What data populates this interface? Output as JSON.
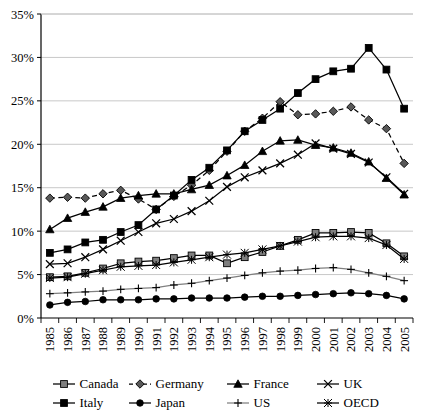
{
  "chart_data": {
    "type": "line",
    "title": "",
    "subtitle": "",
    "xlabel": "",
    "ylabel": "",
    "grid": true,
    "legend_position": "bottom",
    "x": [
      1985,
      1986,
      1987,
      1988,
      1989,
      1990,
      1991,
      1992,
      1993,
      1994,
      1995,
      1996,
      1997,
      1998,
      1999,
      2000,
      2001,
      2002,
      2003,
      2004,
      2005
    ],
    "categories": [
      "1985",
      "1986",
      "1987",
      "1988",
      "1989",
      "1990",
      "1991",
      "1992",
      "1993",
      "1994",
      "1995",
      "1996",
      "1997",
      "1998",
      "1999",
      "2000",
      "2001",
      "2002",
      "2003",
      "2004",
      "2005"
    ],
    "ylim": [
      0,
      35
    ],
    "ytick_values": [
      0,
      5,
      10,
      15,
      20,
      25,
      30,
      35
    ],
    "ytick_labels": [
      "0%",
      "5%",
      "10%",
      "15%",
      "20%",
      "25%",
      "30%",
      "35%"
    ],
    "series": [
      {
        "name": "Canada",
        "marker": "square",
        "marker_fill": "#7f7f7f",
        "line_style": "solid",
        "color": "#000000",
        "values": [
          4.7,
          4.8,
          5.2,
          5.7,
          6.3,
          6.5,
          6.6,
          6.9,
          7.2,
          7.2,
          6.3,
          7.0,
          7.6,
          8.3,
          9.0,
          9.8,
          9.8,
          9.9,
          9.8,
          8.6,
          7.1
        ]
      },
      {
        "name": "Germany",
        "marker": "diamond",
        "marker_fill": "#595959",
        "line_style": "dashed",
        "color": "#000000",
        "values": [
          13.8,
          13.9,
          13.8,
          14.3,
          14.7,
          13.7,
          12.5,
          14.0,
          15.3,
          17.0,
          19.2,
          21.5,
          23.0,
          24.9,
          23.4,
          23.5,
          23.8,
          24.3,
          22.8,
          21.8,
          17.8
        ]
      },
      {
        "name": "France",
        "marker": "triangle",
        "marker_fill": "#000000",
        "line_style": "solid",
        "color": "#000000",
        "values": [
          10.2,
          11.5,
          12.2,
          12.8,
          13.8,
          14.1,
          14.3,
          14.3,
          14.8,
          15.3,
          16.4,
          17.6,
          19.2,
          20.4,
          20.5,
          19.9,
          19.6,
          19.0,
          18.0,
          16.1,
          14.2
        ]
      },
      {
        "name": "UK",
        "marker": "cross-x",
        "marker_fill": "#000000",
        "line_style": "solid",
        "color": "#000000",
        "values": [
          6.2,
          6.3,
          7.0,
          7.9,
          8.9,
          9.9,
          10.9,
          11.4,
          12.3,
          13.5,
          15.1,
          16.2,
          17.0,
          17.8,
          18.8,
          20.1,
          19.5,
          18.9,
          17.9,
          16.2,
          14.3
        ]
      },
      {
        "name": "Italy",
        "marker": "square",
        "marker_fill": "#000000",
        "line_style": "solid",
        "color": "#000000",
        "values": [
          7.5,
          7.9,
          8.7,
          9.0,
          9.9,
          10.7,
          12.5,
          14.1,
          15.9,
          17.3,
          19.3,
          21.5,
          22.8,
          24.1,
          25.9,
          27.5,
          28.4,
          28.7,
          31.1,
          28.6,
          24.1
        ]
      },
      {
        "name": "Japan",
        "marker": "circle",
        "marker_fill": "#000000",
        "line_style": "solid",
        "color": "#000000",
        "values": [
          1.5,
          1.8,
          1.9,
          2.1,
          2.1,
          2.1,
          2.2,
          2.2,
          2.3,
          2.3,
          2.3,
          2.4,
          2.5,
          2.5,
          2.6,
          2.7,
          2.8,
          2.9,
          2.8,
          2.6,
          2.2
        ]
      },
      {
        "name": "US",
        "marker": "plus",
        "marker_fill": "#000000",
        "line_style": "solid",
        "color": "#808080",
        "values": [
          2.8,
          2.9,
          3.0,
          3.1,
          3.3,
          3.4,
          3.5,
          3.8,
          4.0,
          4.3,
          4.6,
          4.9,
          5.2,
          5.4,
          5.5,
          5.7,
          5.8,
          5.6,
          5.2,
          4.8,
          4.3
        ]
      },
      {
        "name": "OECD",
        "marker": "asterisk",
        "marker_fill": "#000000",
        "line_style": "solid",
        "color": "#000000",
        "values": [
          4.6,
          4.7,
          5.1,
          5.5,
          5.9,
          6.0,
          6.1,
          6.4,
          6.7,
          7.0,
          7.3,
          7.5,
          7.9,
          8.3,
          8.8,
          9.3,
          9.4,
          9.4,
          9.2,
          8.4,
          6.8
        ]
      }
    ]
  },
  "legend": {
    "row1": [
      {
        "label": "Canada",
        "key": "square-gray-solid"
      },
      {
        "label": "Germany",
        "key": "diamond-gray-dashed"
      },
      {
        "label": "France",
        "key": "triangle-black-solid"
      },
      {
        "label": "UK",
        "key": "cross-x-black-solid"
      }
    ],
    "row2": [
      {
        "label": "Italy",
        "key": "square-black-solid"
      },
      {
        "label": "Japan",
        "key": "circle-black-solid"
      },
      {
        "label": "US",
        "key": "plus-gray-solid"
      },
      {
        "label": "OECD",
        "key": "asterisk-black-solid"
      }
    ]
  },
  "axes": {
    "y_axis_color": "#000000",
    "grid_color": "#c8c8c8",
    "plot_border_color": "#000000"
  }
}
